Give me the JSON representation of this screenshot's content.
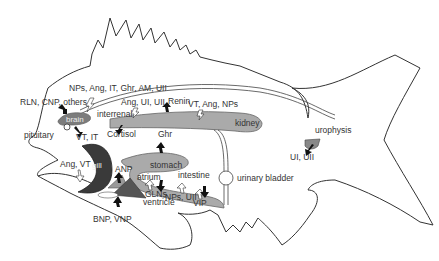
{
  "diagram": {
    "organs": {
      "brain": "brain",
      "pituitary": "pituitary",
      "interrenal": "interrenal",
      "kidney": "kidney",
      "gill": "gill",
      "stomach": "stomach",
      "intestine": "intestine",
      "atrium": "atrium",
      "ventricle": "ventricle",
      "urinary_bladder": "urinary bladder",
      "urophysis": "urophysis"
    },
    "hormones": {
      "brain_input": "NPs, Ang, IT, Ghr, AM, UII",
      "brain_other": "RLN, CNP, others",
      "pituitary_output": "VT, IT",
      "interrenal_input": "Ang, UI, UII",
      "interrenal_output": "Cortisol",
      "kidney_output": "Renin",
      "kidney_input": "VT, Ang, NPs",
      "gill_input": "Ang, VT",
      "stomach_output": "Ghr",
      "atrium_output": "ANP",
      "ventricle_output": "BNP, VNP",
      "intestine_output_1": "GLNs",
      "intestine_input": "NPs, UII",
      "intestine_output_2": "VIP",
      "urophysis_output": "UI, UII"
    },
    "colors": {
      "organ_fill": "#aaaaaa",
      "dark_fill": "#3a3a3a",
      "outline": "#333333"
    }
  }
}
